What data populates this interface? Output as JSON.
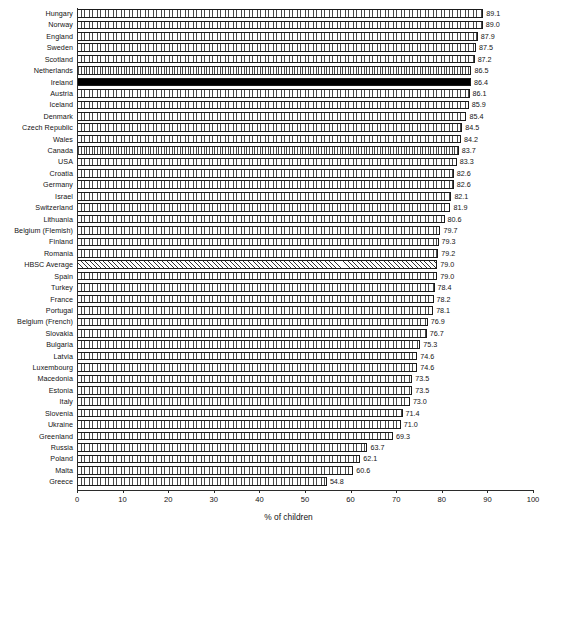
{
  "chart_data": {
    "type": "bar",
    "orientation": "horizontal",
    "title": "",
    "xlabel": "% of children",
    "ylabel": "",
    "xlim": [
      0,
      100
    ],
    "xticks": [
      0,
      10,
      20,
      30,
      40,
      50,
      60,
      70,
      80,
      90,
      100
    ],
    "grid": false,
    "categories": [
      "Hungary",
      "Norway",
      "England",
      "Sweden",
      "Scotland",
      "Netherlands",
      "Ireland",
      "Austria",
      "Iceland",
      "Denmark",
      "Czech Republic",
      "Wales",
      "Canada",
      "USA",
      "Croatia",
      "Germany",
      "Israel",
      "Switzerland",
      "Lithuania",
      "Belgium (Flemish)",
      "Finland",
      "Romania",
      "HBSC Average",
      "Spain",
      "Turkey",
      "France",
      "Portugal",
      "Belgium (French)",
      "Slovakia",
      "Bulgaria",
      "Latvia",
      "Luxembourg",
      "Macedonia",
      "Estonia",
      "Italy",
      "Slovenia",
      "Ukraine",
      "Greenland",
      "Russia",
      "Poland",
      "Malta",
      "Greece"
    ],
    "values": [
      89.1,
      89.0,
      87.9,
      87.5,
      87.2,
      86.5,
      86.4,
      86.1,
      85.9,
      85.4,
      84.5,
      84.2,
      83.7,
      83.3,
      82.6,
      82.6,
      82.1,
      81.9,
      80.6,
      79.7,
      79.3,
      79.2,
      79.0,
      79.0,
      78.4,
      78.2,
      78.1,
      76.9,
      76.7,
      75.3,
      74.6,
      74.6,
      73.5,
      73.5,
      73.0,
      71.4,
      71.0,
      69.3,
      63.7,
      62.1,
      60.6,
      54.8
    ],
    "value_labels": [
      "89.1",
      "89.0",
      "87.9",
      "87.5",
      "87.2",
      "86.5",
      "86.4",
      "86.1",
      "85.9",
      "85.4",
      "84.5",
      "84.2",
      "83.7",
      "83.3",
      "82.6",
      "82.6",
      "82.1",
      "81.9",
      "80.6",
      "79.7",
      "79.3",
      "79.2",
      "79.0",
      "79.0",
      "78.4",
      "78.2",
      "78.1",
      "76.9",
      "76.7",
      "75.3",
      "74.6",
      "74.6",
      "73.5",
      "73.5",
      "73.0",
      "71.4",
      "71.0",
      "69.3",
      "63.7",
      "62.1",
      "60.6",
      "54.8"
    ],
    "highlight": {
      "solid": [
        "Ireland"
      ],
      "hatched": [
        "HBSC Average"
      ]
    },
    "colors": {
      "bar_fill": "#ffffff",
      "bar_edge": "#1a1a1a",
      "highlight_solid": "#000000",
      "axis": "#2b2b2b",
      "text": "#141414"
    }
  }
}
